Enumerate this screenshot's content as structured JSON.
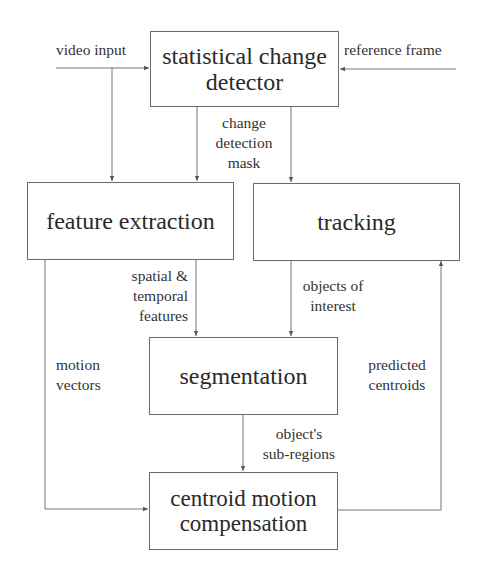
{
  "diagram": {
    "nodes": {
      "change_detector": {
        "label": "statistical change\ndetector"
      },
      "feature_extraction": {
        "label": "feature extraction"
      },
      "tracking": {
        "label": "tracking"
      },
      "segmentation": {
        "label": "segmentation"
      },
      "centroid_compensation": {
        "label": "centroid motion\ncompensation"
      }
    },
    "inputs": {
      "video_input": "video input",
      "reference_frame": "reference frame"
    },
    "edge_labels": {
      "change_detection_mask": "change\ndetection\nmask",
      "spatial_temporal_features": "spatial &\ntemporal\nfeatures",
      "objects_of_interest": "objects of\ninterest",
      "motion_vectors": "motion\nvectors",
      "predicted_centroids": "predicted\ncentroids",
      "object_sub_regions": "object's\nsub-regions"
    },
    "edges": [
      {
        "from": "video input",
        "to": "statistical change detector"
      },
      {
        "from": "reference frame",
        "to": "statistical change detector"
      },
      {
        "from": "video input",
        "to": "feature extraction"
      },
      {
        "from": "statistical change detector",
        "to": "feature extraction",
        "label": "change detection mask"
      },
      {
        "from": "statistical change detector",
        "to": "tracking",
        "label": "change detection mask"
      },
      {
        "from": "feature extraction",
        "to": "segmentation",
        "label": "spatial & temporal features"
      },
      {
        "from": "tracking",
        "to": "segmentation",
        "label": "objects of interest"
      },
      {
        "from": "feature extraction",
        "to": "centroid motion compensation",
        "label": "motion vectors"
      },
      {
        "from": "segmentation",
        "to": "centroid motion compensation",
        "label": "object's sub-regions"
      },
      {
        "from": "centroid motion compensation",
        "to": "tracking",
        "label": "predicted centroids"
      }
    ],
    "colors": {
      "line": "#777777",
      "box_border": "#6a6a6a",
      "text": "#2a2a2a",
      "background": "#ffffff"
    }
  }
}
